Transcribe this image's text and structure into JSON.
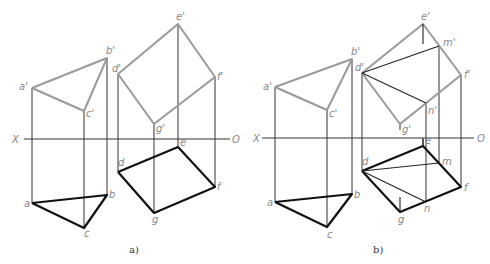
{
  "colors": {
    "front_edge": "#9a9a9a",
    "projection": "#333333",
    "plan_edge": "#111111",
    "aux_line": "#222222",
    "label": "#888888"
  },
  "panels": [
    {
      "id": "a",
      "caption": "a)",
      "caption_pos": [
        129,
        253
      ],
      "axis": {
        "x1": 24,
        "x2": 230,
        "y": 139,
        "left_label": "X",
        "right_label": "O",
        "left_pos": [
          12,
          143
        ],
        "right_pos": [
          232,
          143
        ]
      },
      "front_polylines": [
        [
          [
            32,
            88
          ],
          [
            107,
            58
          ],
          [
            84,
            111
          ],
          [
            32,
            88
          ]
        ],
        [
          [
            118,
            74
          ],
          [
            178,
            24
          ],
          [
            215,
            77
          ],
          [
            154,
            124
          ],
          [
            118,
            74
          ]
        ]
      ],
      "plan_polylines": [
        [
          [
            32,
            203
          ],
          [
            107,
            195
          ],
          [
            84,
            228
          ],
          [
            32,
            203
          ]
        ],
        [
          [
            118,
            172
          ],
          [
            178,
            147
          ],
          [
            215,
            187
          ],
          [
            154,
            213
          ],
          [
            118,
            172
          ]
        ]
      ],
      "projectors": [
        [
          [
            32,
            88
          ],
          [
            32,
            203
          ]
        ],
        [
          [
            107,
            58
          ],
          [
            107,
            195
          ]
        ],
        [
          [
            84,
            111
          ],
          [
            84,
            228
          ]
        ],
        [
          [
            118,
            74
          ],
          [
            118,
            172
          ]
        ],
        [
          [
            178,
            24
          ],
          [
            178,
            147
          ]
        ],
        [
          [
            215,
            77
          ],
          [
            215,
            187
          ]
        ],
        [
          [
            154,
            124
          ],
          [
            154,
            213
          ]
        ]
      ],
      "aux_lines": [],
      "labels": [
        {
          "text": "a'",
          "x": 19,
          "y": 90
        },
        {
          "text": "b'",
          "x": 106,
          "y": 54
        },
        {
          "text": "c'",
          "x": 86,
          "y": 117
        },
        {
          "text": "d'",
          "x": 112,
          "y": 72
        },
        {
          "text": "e'",
          "x": 176,
          "y": 20
        },
        {
          "text": "f'",
          "x": 217,
          "y": 80
        },
        {
          "text": "g'",
          "x": 156,
          "y": 132
        },
        {
          "text": "a",
          "x": 24,
          "y": 207
        },
        {
          "text": "b",
          "x": 109,
          "y": 198
        },
        {
          "text": "c",
          "x": 84,
          "y": 237
        },
        {
          "text": "d",
          "x": 118,
          "y": 166
        },
        {
          "text": "e",
          "x": 180,
          "y": 146
        },
        {
          "text": "f",
          "x": 217,
          "y": 190
        },
        {
          "text": "g",
          "x": 152,
          "y": 223
        }
      ]
    },
    {
      "id": "b",
      "caption": "b)",
      "caption_pos": [
        373,
        253
      ],
      "axis": {
        "x1": 262,
        "x2": 474,
        "y": 138,
        "left_label": "X",
        "right_label": "O",
        "left_pos": [
          253,
          142
        ],
        "right_pos": [
          477,
          142
        ]
      },
      "front_polylines": [
        [
          [
            275,
            87
          ],
          [
            352,
            59
          ],
          [
            327,
            110
          ],
          [
            275,
            87
          ]
        ],
        [
          [
            362,
            73
          ],
          [
            423,
            24
          ],
          [
            461,
            75
          ],
          [
            400,
            124
          ],
          [
            362,
            73
          ]
        ]
      ],
      "plan_polylines": [
        [
          [
            275,
            202
          ],
          [
            352,
            194
          ],
          [
            327,
            227
          ],
          [
            275,
            202
          ]
        ],
        [
          [
            362,
            171
          ],
          [
            423,
            146
          ],
          [
            461,
            187
          ],
          [
            400,
            212
          ],
          [
            362,
            171
          ]
        ]
      ],
      "projectors": [
        [
          [
            275,
            87
          ],
          [
            275,
            202
          ]
        ],
        [
          [
            352,
            59
          ],
          [
            352,
            194
          ]
        ],
        [
          [
            327,
            110
          ],
          [
            327,
            227
          ]
        ],
        [
          [
            362,
            73
          ],
          [
            362,
            171
          ]
        ],
        [
          [
            461,
            75
          ],
          [
            461,
            187
          ]
        ],
        [
          [
            439,
            46
          ],
          [
            439,
            163
          ]
        ],
        [
          [
            426,
            103
          ],
          [
            426,
            202
          ]
        ],
        [
          [
            423,
            138
          ],
          [
            423,
            146
          ]
        ],
        [
          [
            400,
            124
          ],
          [
            400,
            130
          ]
        ]
      ],
      "aux_lines": [
        [
          [
            362,
            73
          ],
          [
            439,
            46
          ]
        ],
        [
          [
            362,
            73
          ],
          [
            426,
            103
          ]
        ],
        [
          [
            423,
            24
          ],
          [
            423,
            44
          ]
        ],
        [
          [
            362,
            171
          ],
          [
            439,
            163
          ]
        ],
        [
          [
            362,
            171
          ],
          [
            426,
            202
          ]
        ],
        [
          [
            400,
            212
          ],
          [
            400,
            197
          ]
        ],
        [
          [
            423,
            146
          ],
          [
            423,
            139
          ]
        ]
      ],
      "labels": [
        {
          "text": "a'",
          "x": 263,
          "y": 90
        },
        {
          "text": "b'",
          "x": 351,
          "y": 55
        },
        {
          "text": "c'",
          "x": 329,
          "y": 117
        },
        {
          "text": "d'",
          "x": 355,
          "y": 71
        },
        {
          "text": "e'",
          "x": 421,
          "y": 20
        },
        {
          "text": "m'",
          "x": 443,
          "y": 46
        },
        {
          "text": "f'",
          "x": 464,
          "y": 78
        },
        {
          "text": "n'",
          "x": 428,
          "y": 114
        },
        {
          "text": "g'",
          "x": 402,
          "y": 133
        },
        {
          "text": "a",
          "x": 267,
          "y": 206
        },
        {
          "text": "b",
          "x": 354,
          "y": 198
        },
        {
          "text": "c",
          "x": 327,
          "y": 238
        },
        {
          "text": "d",
          "x": 362,
          "y": 165
        },
        {
          "text": "e",
          "x": 425,
          "y": 144
        },
        {
          "text": "m",
          "x": 442,
          "y": 165
        },
        {
          "text": "f",
          "x": 464,
          "y": 191
        },
        {
          "text": "n",
          "x": 424,
          "y": 212
        },
        {
          "text": "g",
          "x": 398,
          "y": 223
        }
      ]
    }
  ]
}
